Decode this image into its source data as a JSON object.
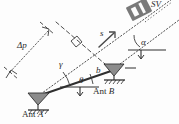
{
  "figure": {
    "type": "interferometric-baseline-geometry-diagram",
    "background_color": "#fdfdfd",
    "ink_color": "#2b2b2b"
  },
  "labels": {
    "delta_p": "Δp",
    "slant_range": "s",
    "alpha": "α",
    "gamma": "γ",
    "theta": "θ",
    "baseline": "b",
    "antenna_a_prefix": "Ant ",
    "antenna_a_name": "A",
    "antenna_b_prefix": "Ant ",
    "antenna_b_name": "B",
    "sv_label": "SV"
  },
  "elements": {
    "right_angle_marker": "right-angle-square",
    "antenna_a_symbol": "antenna-triangle",
    "antenna_b_symbol": "antenna-triangle",
    "ground_hatch_a": "hatched-ground",
    "ground_hatch_b": "hatched-ground",
    "line_of_sight_a": "dotted-line",
    "line_of_sight_b": "dotted-line",
    "baseline_line": "solid-thick-line",
    "delta_p_arrow": "double-headed-dotted-arrow",
    "horizontal_reference_a": "solid-reference-line",
    "horizontal_reference_b": "solid-reference-line"
  }
}
